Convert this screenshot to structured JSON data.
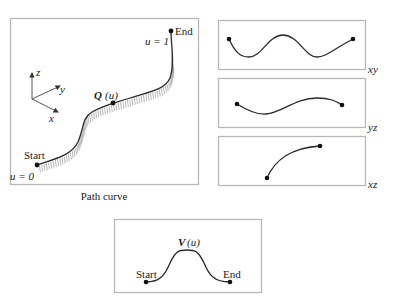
{
  "main_panel": {
    "caption": "Path curve",
    "start_label": "Start",
    "end_label": "End",
    "u_start": "u = 0",
    "u_end": "u = 1",
    "point_symbol": "Q",
    "point_arg": "(u)",
    "axes": {
      "z": "z",
      "y": "y",
      "x": "x"
    }
  },
  "projections": [
    {
      "label": "xy"
    },
    {
      "label": "yz"
    },
    {
      "label": "xz"
    }
  ],
  "velocity_panel": {
    "symbol": "V",
    "arg": "(u)",
    "start_label": "Start",
    "end_label": "End"
  }
}
